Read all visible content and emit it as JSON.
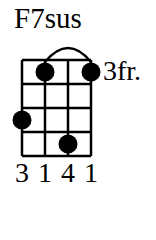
{
  "chord": {
    "name": "F7sus",
    "start_fret_label": "3fr.",
    "strings": 4,
    "frets": 4,
    "positions": [
      {
        "string": 1,
        "fret": 3
      },
      {
        "string": 2,
        "fret": 1
      },
      {
        "string": 3,
        "fret": 4
      },
      {
        "string": 4,
        "fret": 1
      }
    ],
    "barre": {
      "from_string": 2,
      "to_string": 4,
      "fret": 1
    },
    "fingering": [
      "3",
      "1",
      "4",
      "1"
    ]
  }
}
